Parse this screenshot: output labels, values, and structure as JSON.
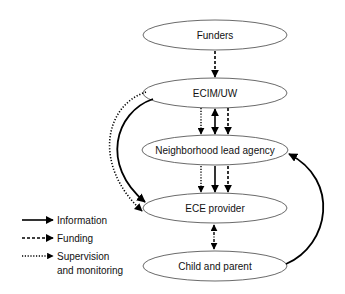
{
  "diagram": {
    "type": "flow",
    "nodes": [
      {
        "id": "funders",
        "label": "Funders"
      },
      {
        "id": "ecim",
        "label": "ECIM/UW"
      },
      {
        "id": "nla",
        "label": "Neighborhood lead agency"
      },
      {
        "id": "ece",
        "label": "ECE provider"
      },
      {
        "id": "child",
        "label": "Child and parent"
      }
    ],
    "edges": [
      {
        "from": "funders",
        "to": "ecim",
        "style": "dashed",
        "meaning": "Funding"
      },
      {
        "from": "ecim",
        "to": "nla",
        "style": "dotted",
        "meaning": "Supervision and monitoring"
      },
      {
        "from": "ecim",
        "to": "nla",
        "style": "solid",
        "meaning": "Information",
        "bidirectional": true
      },
      {
        "from": "ecim",
        "to": "nla",
        "style": "dashed",
        "meaning": "Funding"
      },
      {
        "from": "nla",
        "to": "ece",
        "style": "dotted",
        "meaning": "Supervision and monitoring"
      },
      {
        "from": "nla",
        "to": "ece",
        "style": "solid",
        "meaning": "Information"
      },
      {
        "from": "nla",
        "to": "ece",
        "style": "dashed",
        "meaning": "Funding"
      },
      {
        "from": "ecim",
        "to": "ece",
        "style": "dotted",
        "meaning": "Supervision and monitoring",
        "curved": true
      },
      {
        "from": "ecim",
        "to": "ece",
        "style": "solid",
        "meaning": "Information",
        "curved": true
      },
      {
        "from": "ece",
        "to": "child",
        "style": "dash-dot",
        "bidirectional": true
      },
      {
        "from": "child",
        "to": "nla",
        "style": "solid",
        "meaning": "Information",
        "curved": true
      }
    ]
  },
  "legend": {
    "items": [
      {
        "style": "solid",
        "label": "Information"
      },
      {
        "style": "dashed",
        "label": "Funding"
      },
      {
        "style": "dotted",
        "label": "Supervision",
        "label2": "and monitoring"
      }
    ]
  }
}
